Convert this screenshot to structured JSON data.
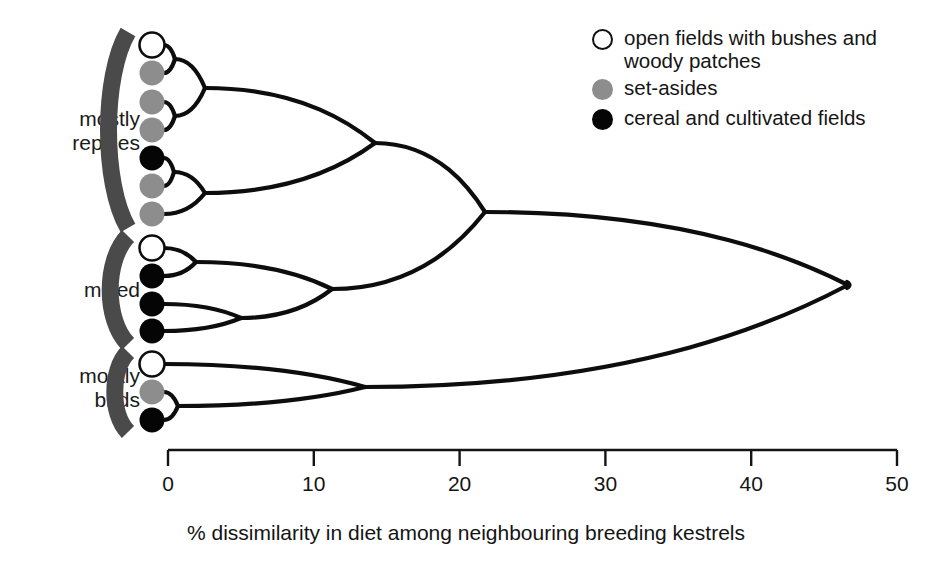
{
  "figure": {
    "title": "",
    "group_labels": [
      {
        "id": "mostly-reptiles",
        "text": "mostly\nreptiles",
        "x": 22,
        "y": 107,
        "width": 118
      },
      {
        "id": "mixed",
        "text": "mixed",
        "x": 22,
        "y": 278,
        "width": 118
      },
      {
        "id": "mostly-birds",
        "text": "mostly\nbirds",
        "x": 22,
        "y": 364,
        "width": 118
      }
    ],
    "legend": {
      "items": [
        {
          "marker": "open-circle",
          "color": "#ffffff",
          "label": "open fields with bushes and woody patches"
        },
        {
          "marker": "grey-circle",
          "color": "#8d8d8d",
          "label": "set-asides"
        },
        {
          "marker": "black-circle",
          "color": "#050505",
          "label": "cereal and cultivated fields"
        }
      ]
    },
    "axis": {
      "title": "% dissimilarity in diet among neighbouring breeding kestrels",
      "ticks": [
        0,
        10,
        20,
        30,
        40,
        50
      ],
      "tick_labels": [
        "0",
        "10",
        "20",
        "30",
        "40",
        "50"
      ],
      "range": [
        0,
        50
      ],
      "pixel_x_at_min": 168,
      "pixel_x_at_max": 897,
      "pixel_y": 450
    }
  },
  "chart_data": {
    "type": "dendrogram",
    "title": "",
    "xlabel": "% dissimilarity in diet among neighbouring breeding kestrels",
    "ylabel": "",
    "xlim": [
      0,
      50
    ],
    "grid": false,
    "legend_position": "top-right",
    "marker_colors": {
      "open fields with bushes and woody patches": "#ffffff",
      "set-asides": "#8d8d8d",
      "cereal and cultivated fields": "#050505"
    },
    "groups": [
      {
        "name": "mostly reptiles",
        "n_tips": 7,
        "tip_habitats": [
          "open fields with bushes and woody patches",
          "set-asides",
          "set-asides",
          "set-asides",
          "cereal and cultivated fields",
          "set-asides",
          "set-asides"
        ]
      },
      {
        "name": "mixed",
        "n_tips": 4,
        "tip_habitats": [
          "open fields with bushes and woody patches",
          "cereal and cultivated fields",
          "cereal and cultivated fields",
          "cereal and cultivated fields"
        ]
      },
      {
        "name": "mostly birds",
        "n_tips": 3,
        "tip_habitats": [
          "open fields with bushes and woody patches",
          "set-asides",
          "cereal and cultivated fields"
        ]
      }
    ],
    "tips": [
      {
        "id": "t1",
        "group": "mostly reptiles",
        "habitat": "open fields with bushes and woody patches",
        "y": 45
      },
      {
        "id": "t2",
        "group": "mostly reptiles",
        "habitat": "set-asides",
        "y": 73
      },
      {
        "id": "t3",
        "group": "mostly reptiles",
        "habitat": "set-asides",
        "y": 102
      },
      {
        "id": "t4",
        "group": "mostly reptiles",
        "habitat": "set-asides",
        "y": 130
      },
      {
        "id": "t5",
        "group": "mostly reptiles",
        "habitat": "cereal and cultivated fields",
        "y": 158
      },
      {
        "id": "t6",
        "group": "mostly reptiles",
        "habitat": "set-asides",
        "y": 186
      },
      {
        "id": "t7",
        "group": "mostly reptiles",
        "habitat": "set-asides",
        "y": 214
      },
      {
        "id": "t8",
        "group": "mixed",
        "habitat": "open fields with bushes and woody patches",
        "y": 248
      },
      {
        "id": "t9",
        "group": "mixed",
        "habitat": "cereal and cultivated fields",
        "y": 276
      },
      {
        "id": "t10",
        "group": "mixed",
        "habitat": "cereal and cultivated fields",
        "y": 304
      },
      {
        "id": "t11",
        "group": "mixed",
        "habitat": "cereal and cultivated fields",
        "y": 331
      },
      {
        "id": "t12",
        "group": "mostly birds",
        "habitat": "open fields with bushes and woody patches",
        "y": 364
      },
      {
        "id": "t13",
        "group": "mostly birds",
        "habitat": "set-asides",
        "y": 392
      },
      {
        "id": "t14",
        "group": "mostly birds",
        "habitat": "cereal and cultivated fields",
        "y": 420
      }
    ],
    "merges": [
      {
        "id": "n1",
        "children": [
          "t1",
          "t2"
        ],
        "dissimilarity": 0.5,
        "x": 175,
        "y": 59
      },
      {
        "id": "n2",
        "children": [
          "t3",
          "t4"
        ],
        "dissimilarity": 0.5,
        "x": 175,
        "y": 116
      },
      {
        "id": "n3",
        "children": [
          "n1",
          "n2"
        ],
        "dissimilarity": 2.5,
        "x": 205,
        "y": 88
      },
      {
        "id": "n4",
        "children": [
          "t5",
          "t6"
        ],
        "dissimilarity": 0.4,
        "x": 174,
        "y": 172
      },
      {
        "id": "n5",
        "children": [
          "n4",
          "t7"
        ],
        "dissimilarity": 2.5,
        "x": 205,
        "y": 193
      },
      {
        "id": "n6",
        "children": [
          "n3",
          "n5"
        ],
        "dissimilarity": 14.2,
        "x": 375,
        "y": 143
      },
      {
        "id": "n7",
        "children": [
          "t8",
          "t9"
        ],
        "dissimilarity": 1.9,
        "x": 196,
        "y": 262
      },
      {
        "id": "n8",
        "children": [
          "t10",
          "t11"
        ],
        "dissimilarity": 5.0,
        "x": 241,
        "y": 318
      },
      {
        "id": "n9",
        "children": [
          "n7",
          "n8"
        ],
        "dissimilarity": 11.2,
        "x": 332,
        "y": 289
      },
      {
        "id": "n10",
        "children": [
          "n6",
          "n9"
        ],
        "dissimilarity": 21.7,
        "x": 485,
        "y": 212
      },
      {
        "id": "n11",
        "children": [
          "t13",
          "t14"
        ],
        "dissimilarity": 0.7,
        "x": 178,
        "y": 406
      },
      {
        "id": "n12",
        "children": [
          "t12",
          "n11"
        ],
        "dissimilarity": 13.5,
        "x": 365,
        "y": 387
      },
      {
        "id": "n13",
        "children": [
          "n10",
          "n12"
        ],
        "dissimilarity": 46.6,
        "x": 848,
        "y": 285
      }
    ],
    "brackets": [
      {
        "group": "mostly reptiles",
        "x": 128,
        "y_top": 32,
        "y_bottom": 228
      },
      {
        "group": "mixed",
        "x": 128,
        "y_top": 236,
        "y_bottom": 344
      },
      {
        "group": "mostly birds",
        "x": 128,
        "y_top": 352,
        "y_bottom": 432
      }
    ]
  }
}
